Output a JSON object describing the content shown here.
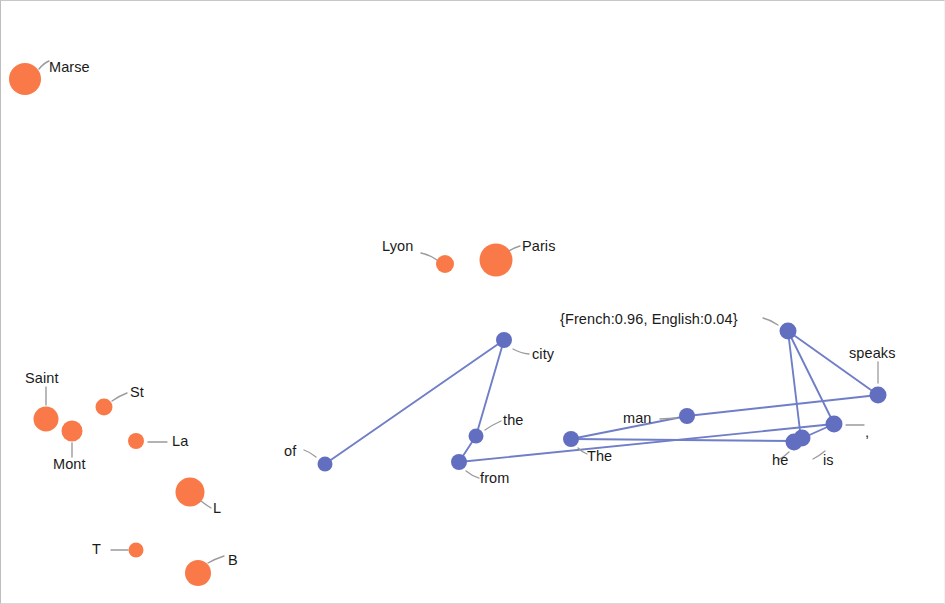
{
  "figure": {
    "type": "node-link-embedding-plot",
    "background_color": "#ffffff",
    "entity_node_color": "#f97a48",
    "token_node_color": "#626fc0",
    "edge_color": "#6f7ec7",
    "leader_line_color": "#9b9b9b",
    "label_color": "#1a1a1a",
    "width": 945,
    "height": 604
  },
  "entity_nodes": [
    {
      "label": "Marse",
      "cx": 24,
      "cy": 78,
      "r": 16,
      "label_x": 48,
      "label_y": 59,
      "leader": [
        38,
        66,
        46,
        62
      ]
    },
    {
      "label": "Lyon",
      "cx": 444,
      "cy": 263,
      "r": 9,
      "label_x": 382,
      "label_y": 238,
      "leader": [
        424,
        252,
        437,
        259
      ]
    },
    {
      "label": "Paris",
      "cx": 495,
      "cy": 259,
      "r": 16.5,
      "label_x": 522,
      "label_y": 239,
      "leader": [
        507,
        250,
        518,
        245
      ]
    },
    {
      "label": "Saint",
      "cx": 45,
      "cy": 418,
      "r": 12.5,
      "label_x": 24,
      "label_y": 371,
      "leader": [
        45,
        404,
        45,
        386
      ]
    },
    {
      "label": "Mont",
      "cx": 71,
      "cy": 430,
      "r": 10.5,
      "label_x": 53,
      "label_y": 457,
      "leader": [
        71,
        441,
        71,
        455
      ]
    },
    {
      "label": "St",
      "cx": 103,
      "cy": 406,
      "r": 8.5,
      "label_x": 130,
      "label_y": 384,
      "leader": [
        112,
        399,
        124,
        393
      ]
    },
    {
      "label": "La",
      "cx": 135,
      "cy": 440,
      "r": 8,
      "label_x": 173,
      "label_y": 434,
      "leader": [
        147,
        441,
        166,
        441
      ]
    },
    {
      "label": "L",
      "cx": 189,
      "cy": 491,
      "r": 14.5,
      "label_x": 212,
      "label_y": 501,
      "leader": [
        200,
        501,
        209,
        507
      ]
    },
    {
      "label": "T",
      "cx": 135,
      "cy": 549,
      "r": 7.5,
      "label_x": 93,
      "label_y": 541,
      "leader": [
        110,
        549,
        126,
        549
      ]
    },
    {
      "label": "B",
      "cx": 197,
      "cy": 572,
      "r": 13,
      "label_x": 229,
      "label_y": 553,
      "leader": [
        208,
        562,
        222,
        556
      ]
    }
  ],
  "token_nodes": [
    {
      "label": "of",
      "cx": 324,
      "cy": 463,
      "r": 7.5,
      "label_x": 284,
      "label_y": 444,
      "leader": [
        315,
        455,
        304,
        450
      ]
    },
    {
      "label": "city",
      "cx": 503,
      "cy": 339,
      "r": 8,
      "label_x": 534,
      "label_y": 348,
      "leader": [
        513,
        348,
        527,
        353
      ]
    },
    {
      "label": "the",
      "cx": 475,
      "cy": 435,
      "r": 7.5,
      "label_x": 504,
      "label_y": 413,
      "leader": [
        484,
        428,
        498,
        421
      ]
    },
    {
      "label": "from",
      "cx": 458,
      "cy": 461,
      "r": 8,
      "label_x": 480,
      "label_y": 471,
      "leader": [
        466,
        470,
        476,
        476
      ]
    },
    {
      "label": "The",
      "cx": 570,
      "cy": 438,
      "r": 8,
      "label_x": 586,
      "label_y": 450,
      "leader": [
        577,
        447,
        584,
        453
      ]
    },
    {
      "label": "man",
      "cx": 686,
      "cy": 415,
      "r": 8,
      "label_x": 623,
      "label_y": 411,
      "leader": [
        666,
        419,
        678,
        418
      ]
    },
    {
      "label": "he",
      "cx": 793,
      "cy": 440,
      "r": 8.5,
      "label_x": 774,
      "label_y": 452,
      "leader": [
        789,
        450,
        796,
        457
      ]
    },
    {
      "label": "he2",
      "cx": 800,
      "cy": 438,
      "r": 8.5,
      "label_x": null,
      "label_y": null,
      "leader": null
    },
    {
      "label": "is",
      "cx": 833,
      "cy": 423,
      "r": 8.5,
      "label_x": 826,
      "label_y": 452,
      "leader": [
        824,
        449,
        816,
        452
      ]
    },
    {
      "label": "speaks",
      "cx": 877,
      "cy": 394,
      "r": 8.5,
      "label_x": 849,
      "label_y": 346,
      "leader": [
        877,
        383,
        877,
        362
      ]
    },
    {
      "label": "{French:0.96, English:0.04}",
      "cx": 787,
      "cy": 330,
      "r": 8.5,
      "label_x": 560,
      "label_y": 312,
      "leader": [
        777,
        324,
        768,
        318
      ]
    }
  ],
  "edges": [
    {
      "from": "of",
      "to": "city"
    },
    {
      "from": "city",
      "to": "the"
    },
    {
      "from": "the",
      "to": "from"
    },
    {
      "from": "from",
      "to": "is"
    },
    {
      "from": "The",
      "to": "man"
    },
    {
      "from": "man",
      "to": "speaks"
    },
    {
      "from": "The",
      "to": "he"
    },
    {
      "from": "he",
      "to": "is"
    },
    {
      "from": "is",
      "to": "french"
    },
    {
      "from": "french",
      "to": "speaks"
    },
    {
      "from": "french",
      "to": "he2"
    }
  ],
  "labels": {
    "marse": "Marse",
    "lyon": "Lyon",
    "paris": "Paris",
    "saint": "Saint",
    "mont": "Mont",
    "st": "St",
    "la": "La",
    "l": "L",
    "t": "T",
    "b": "B",
    "of": "of",
    "city": "city",
    "the": "the",
    "from": "from",
    "the_cap": "The",
    "man": "man",
    "he": "he",
    "is": "is",
    "speaks": "speaks",
    "french_prob": "{French:0.96, English:0.04}",
    "comma": ","
  }
}
